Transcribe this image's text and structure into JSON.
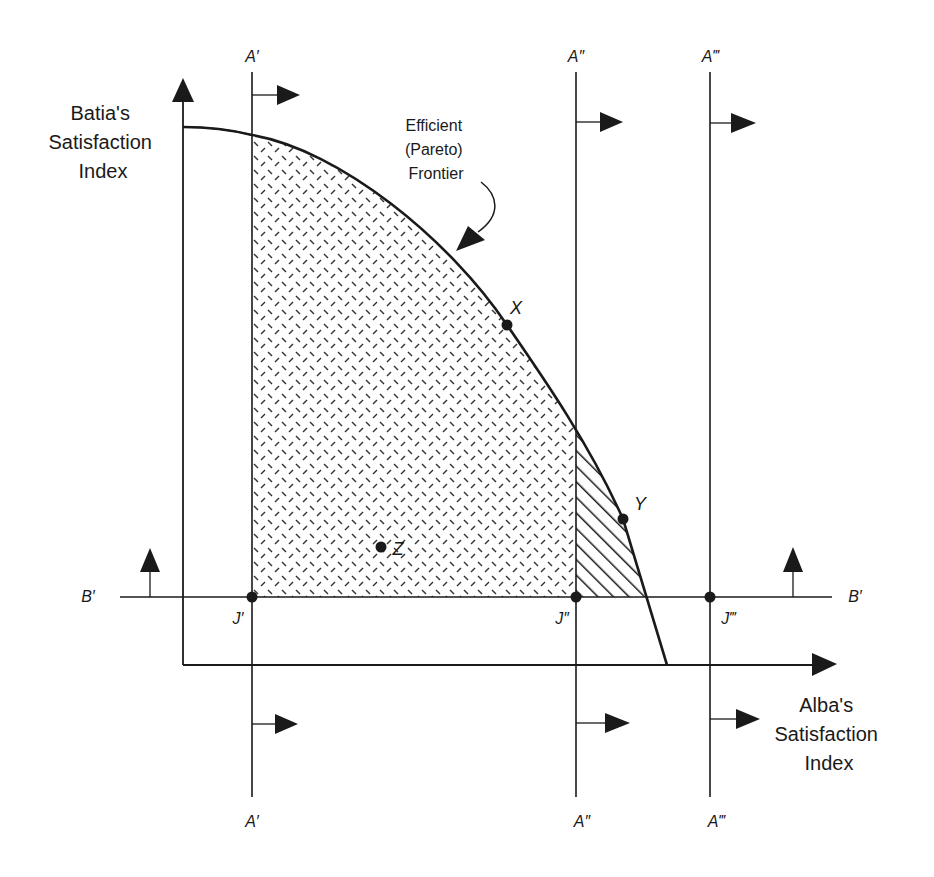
{
  "figure": {
    "type": "pareto-frontier-diagram",
    "colors": {
      "ink": "#1a1a1a",
      "background": "#ffffff"
    },
    "axes": {
      "y_label": [
        "Batia's",
        "Satisfaction",
        "Index"
      ],
      "x_label": [
        "Alba's",
        "Satisfaction",
        "Index"
      ]
    },
    "frontier_label": [
      "Efficient",
      "(Pareto)",
      "Frontier"
    ],
    "vertical_lines": [
      {
        "id": "A1",
        "label_top": "A′",
        "label_bottom": "A′",
        "x": 252
      },
      {
        "id": "A2",
        "label_top": "A″",
        "label_bottom": "A″",
        "x": 576
      },
      {
        "id": "A3",
        "label_top": "A‴",
        "label_bottom": "A‴",
        "x": 710
      }
    ],
    "horizontal_line": {
      "label_left": "B′",
      "label_right": "B′",
      "y": 597
    },
    "intersections": [
      {
        "label": "J′",
        "x": 252,
        "y": 597
      },
      {
        "label": "J″",
        "x": 576,
        "y": 597
      },
      {
        "label": "J‴",
        "x": 710,
        "y": 597
      }
    ],
    "points": [
      {
        "label": "X",
        "x": 507,
        "y": 325,
        "position": "on-frontier"
      },
      {
        "label": "Y",
        "x": 623,
        "y": 519,
        "position": "on-frontier"
      },
      {
        "label": "Z",
        "x": 381,
        "y": 547,
        "position": "interior"
      }
    ],
    "regions": [
      {
        "name": "feasible-region-above-J1",
        "fill": "diamond-dash-texture"
      },
      {
        "name": "feasible-region-above-J2",
        "fill": "diagonal-hatch"
      }
    ]
  }
}
